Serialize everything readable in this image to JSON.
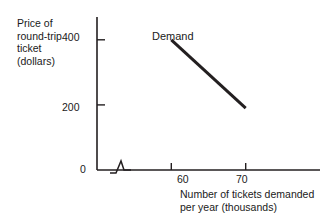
{
  "chart_data": {
    "type": "line",
    "title": "",
    "xlabel": "Number of tickets demanded per year (thousands)",
    "xlabel_line1": "Number of tickets demanded",
    "xlabel_line2": "per year (thousands)",
    "ylabel": "Price of round-trip ticket (dollars)",
    "ylabel_line1": "Price of",
    "ylabel_line2": "round-trip",
    "ylabel_line3": "ticket",
    "ylabel_line4": "(dollars)",
    "series": [
      {
        "name": "Demand",
        "x": [
          60,
          70
        ],
        "values": [
          400,
          190
        ],
        "color": "#231f20",
        "line_width": 3
      }
    ],
    "x_ticks": [
      60,
      70
    ],
    "x_tick_labels": [
      "60",
      "70"
    ],
    "y_ticks": [
      0,
      200,
      400
    ],
    "y_tick_labels": [
      "0",
      "200",
      "400"
    ],
    "xlim": [
      50,
      80
    ],
    "ylim": [
      0,
      470
    ],
    "grid": false,
    "legend_position": "inline-annotation",
    "annotations": [
      {
        "text": "Demand",
        "x": 62,
        "y": 440
      }
    ],
    "axis_break": {
      "axis": "x",
      "symbol": "zigzag",
      "note": "break mark on horizontal axis near origin"
    },
    "axis_color": "#231f20"
  }
}
